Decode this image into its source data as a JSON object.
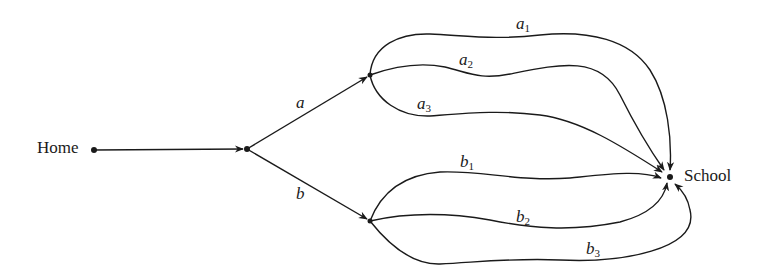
{
  "diagram": {
    "type": "directed-graph",
    "nodes": [
      {
        "id": "home",
        "label": "Home"
      },
      {
        "id": "split",
        "label": ""
      },
      {
        "id": "upper",
        "label": ""
      },
      {
        "id": "lower",
        "label": ""
      },
      {
        "id": "school",
        "label": "School"
      }
    ],
    "edges": [
      {
        "from": "home",
        "to": "split",
        "label": ""
      },
      {
        "from": "split",
        "to": "upper",
        "label": "a"
      },
      {
        "from": "split",
        "to": "lower",
        "label": "b"
      },
      {
        "from": "upper",
        "to": "school",
        "label": "a1",
        "base": "a",
        "sub": "1"
      },
      {
        "from": "upper",
        "to": "school",
        "label": "a2",
        "base": "a",
        "sub": "2"
      },
      {
        "from": "upper",
        "to": "school",
        "label": "a3",
        "base": "a",
        "sub": "3"
      },
      {
        "from": "lower",
        "to": "school",
        "label": "b1",
        "base": "b",
        "sub": "1"
      },
      {
        "from": "lower",
        "to": "school",
        "label": "b2",
        "base": "b",
        "sub": "2"
      },
      {
        "from": "lower",
        "to": "school",
        "label": "b3",
        "base": "b",
        "sub": "3"
      }
    ],
    "colors": {
      "stroke": "#1a1a1a",
      "background": "#ffffff"
    }
  }
}
